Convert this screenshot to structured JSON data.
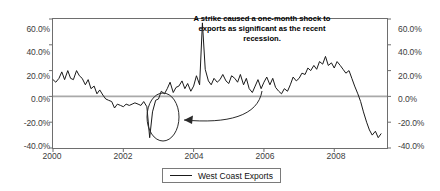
{
  "chart_data": {
    "type": "line",
    "title": "",
    "xlabel": "",
    "ylabel": "",
    "ylim": [
      -40,
      60
    ],
    "xlim": [
      2000.0,
      2009.5
    ],
    "grid": false,
    "legend_position": "bottom-center",
    "y_tick_labels": [
      "60.0%",
      "40.0%",
      "20.0%",
      "0.0%",
      "-20.0%",
      "-40.0%"
    ],
    "y_tick_values": [
      60,
      40,
      20,
      0,
      -20,
      -40
    ],
    "y_axis_right_tick_labels": [
      "60.0%",
      "40.0%",
      "20.0%",
      "0.0%",
      "-20.0%",
      "-40.0%"
    ],
    "x_tick_labels": [
      "2000",
      "2002",
      "2004",
      "2006",
      "2008"
    ],
    "x_tick_values": [
      2000,
      2002,
      2004,
      2006,
      2008
    ],
    "zero_line": 0,
    "annotations": [
      {
        "text": "A strike caused a one-month shock to exports as significant as the recent recession.",
        "points_to": "circled-dip-late-2002",
        "marker": "ellipse",
        "connector": "curved-arrow"
      }
    ],
    "series": [
      {
        "name": "West Coast Exports",
        "color": "#1a1a1a",
        "x": [
          2000.0,
          2000.08,
          2000.17,
          2000.25,
          2000.33,
          2000.42,
          2000.5,
          2000.58,
          2000.67,
          2000.75,
          2000.83,
          2000.92,
          2001.0,
          2001.08,
          2001.17,
          2001.25,
          2001.33,
          2001.42,
          2001.5,
          2001.58,
          2001.67,
          2001.75,
          2001.83,
          2001.92,
          2002.0,
          2002.08,
          2002.17,
          2002.25,
          2002.33,
          2002.42,
          2002.5,
          2002.58,
          2002.67,
          2002.75,
          2002.83,
          2002.92,
          2003.0,
          2003.08,
          2003.17,
          2003.25,
          2003.33,
          2003.42,
          2003.5,
          2003.58,
          2003.67,
          2003.75,
          2003.83,
          2003.92,
          2004.0,
          2004.08,
          2004.17,
          2004.25,
          2004.33,
          2004.42,
          2004.5,
          2004.58,
          2004.67,
          2004.75,
          2004.83,
          2004.92,
          2005.0,
          2005.08,
          2005.17,
          2005.25,
          2005.33,
          2005.42,
          2005.5,
          2005.58,
          2005.67,
          2005.75,
          2005.83,
          2005.92,
          2006.0,
          2006.08,
          2006.17,
          2006.25,
          2006.33,
          2006.42,
          2006.5,
          2006.58,
          2006.67,
          2006.75,
          2006.83,
          2006.92,
          2007.0,
          2007.08,
          2007.17,
          2007.25,
          2007.33,
          2007.42,
          2007.5,
          2007.58,
          2007.67,
          2007.75,
          2007.83,
          2007.92,
          2008.0,
          2008.08,
          2008.17,
          2008.25,
          2008.33,
          2008.42,
          2008.5,
          2008.58,
          2008.67,
          2008.75,
          2008.83,
          2008.92,
          2009.0,
          2009.08,
          2009.17,
          2009.25,
          2009.33
        ],
        "values": [
          13,
          11,
          14,
          19,
          13,
          20,
          14,
          13,
          20,
          16,
          14,
          9,
          13,
          6,
          8,
          2,
          5,
          1,
          -2,
          -3,
          -4,
          -9,
          -6,
          -7,
          -8,
          -6,
          -7,
          -6,
          -5,
          -6,
          -7,
          -4,
          -8,
          -32,
          -12,
          -3,
          -2,
          4,
          2,
          6,
          11,
          3,
          7,
          8,
          12,
          6,
          10,
          4,
          8,
          16,
          9,
          57,
          21,
          12,
          9,
          14,
          11,
          13,
          17,
          12,
          10,
          16,
          14,
          11,
          17,
          9,
          14,
          6,
          3,
          8,
          13,
          6,
          11,
          15,
          9,
          14,
          7,
          4,
          2,
          6,
          4,
          9,
          15,
          12,
          14,
          18,
          17,
          22,
          20,
          24,
          21,
          27,
          25,
          31,
          24,
          26,
          22,
          27,
          24,
          21,
          18,
          20,
          14,
          8,
          2,
          -4,
          -12,
          -20,
          -26,
          -30,
          -27,
          -32,
          -29
        ]
      }
    ]
  },
  "legend": {
    "entries": [
      {
        "label": "West Coast Exports"
      }
    ]
  }
}
